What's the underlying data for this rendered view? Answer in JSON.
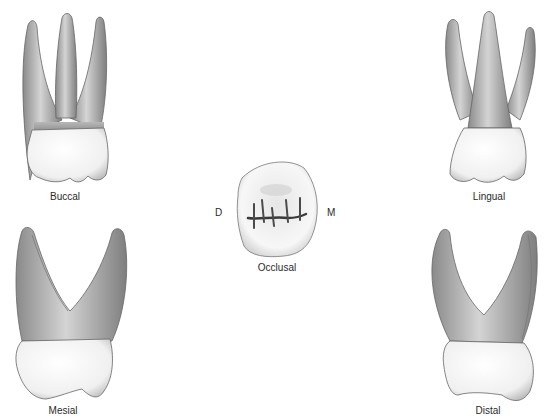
{
  "figure": {
    "views": [
      {
        "id": "buccal",
        "label": "Buccal"
      },
      {
        "id": "lingual",
        "label": "Lingual"
      },
      {
        "id": "occlusal",
        "label": "Occlusal"
      },
      {
        "id": "mesial",
        "label": "Mesial"
      },
      {
        "id": "distal",
        "label": "Distal"
      }
    ],
    "orientation": {
      "left": "D",
      "right": "M"
    }
  },
  "colors": {
    "background": "#ffffff",
    "root": "#9a9a9a",
    "root_light": "#d0d0d0",
    "crown": "#f4f4f4",
    "outline": "#555555",
    "groove": "#3a3a3a"
  }
}
